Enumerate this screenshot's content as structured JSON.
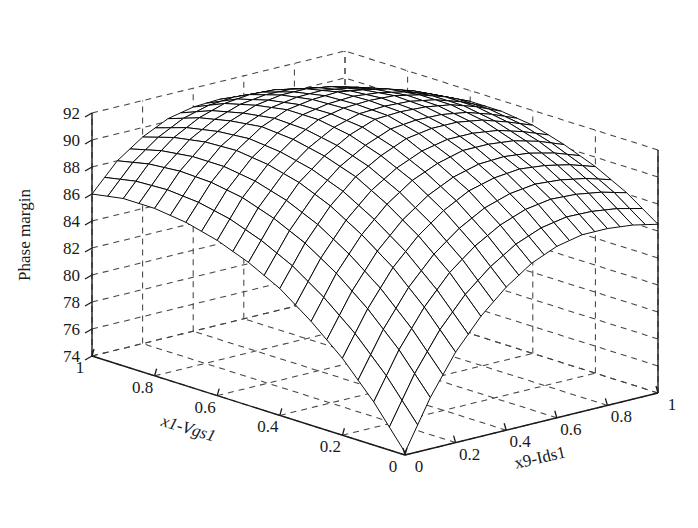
{
  "figure": {
    "background_color": "#ffffff",
    "line_color": "#1a1a1a",
    "grid_color": "#3a3a3a",
    "mesh_color": "#000000",
    "mesh_face_color": "#ffffff"
  },
  "chart_data": {
    "type": "surface",
    "title": "",
    "zlabel": "Phase margin",
    "xlabel": "x1-Vgs1",
    "ylabel": "x9-Ids1",
    "grid": true,
    "legend": "none",
    "projection": "3d-mesh",
    "xlim": [
      0,
      1
    ],
    "ylim": [
      0,
      1
    ],
    "zlim": [
      74,
      92
    ],
    "xticks": [
      "1",
      "0.8",
      "0.6",
      "0.4",
      "0.2",
      "0"
    ],
    "xtick_values": [
      1,
      0.8,
      0.6,
      0.4,
      0.2,
      0
    ],
    "yticks": [
      "0",
      "0.2",
      "0.4",
      "0.6",
      "0.8",
      "1"
    ],
    "ytick_values": [
      0,
      0.2,
      0.4,
      0.6,
      0.8,
      1
    ],
    "zticks": [
      "74",
      "76",
      "78",
      "80",
      "82",
      "84",
      "86",
      "88",
      "90",
      "92"
    ],
    "ztick_values": [
      74,
      76,
      78,
      80,
      82,
      84,
      86,
      88,
      90,
      92
    ],
    "x_axis_name": "x1-Vgs1",
    "y_axis_name": "x9-Ids1",
    "z_axis_name": "Phase margin",
    "x_grid_values": [
      0,
      0.2,
      0.4,
      0.6,
      0.8,
      1
    ],
    "y_grid_values": [
      0,
      0.2,
      0.4,
      0.6,
      0.8,
      1
    ],
    "mesh_nx": 21,
    "mesh_ny": 21,
    "surface_model": {
      "description": "Phase margin rises steeply as x1-Vgs1 decreases from 1 and as x9-Ids1 increases, saturating to a broad ridge near 92-93 and rolling off toward the x9=1 front-right corner.",
      "z_at_corners": {
        "x1_1_x9_0": 74.2,
        "x1_0_x9_0": 88.0,
        "x1_1_x9_1": 86.5,
        "x1_0_x9_1": 89.2
      },
      "z_peak": 93.0,
      "peak_at": [
        0.3,
        0.62
      ]
    },
    "z_grid_x": [
      0,
      0.1,
      0.2,
      0.3,
      0.4,
      0.5,
      0.6,
      0.7,
      0.8,
      0.9,
      1
    ],
    "z_grid_y": [
      0,
      0.1,
      0.2,
      0.3,
      0.4,
      0.5,
      0.6,
      0.7,
      0.8,
      0.9,
      1
    ],
    "z_values": [
      [
        74.2,
        77.8,
        80.7,
        82.9,
        84.6,
        85.9,
        86.7,
        87.1,
        87.1,
        86.9,
        86.5
      ],
      [
        77.2,
        80.6,
        83.3,
        85.4,
        86.9,
        88.0,
        88.7,
        89.0,
        88.9,
        88.6,
        88.1
      ],
      [
        79.7,
        82.9,
        85.5,
        87.4,
        88.8,
        89.8,
        90.3,
        90.5,
        90.3,
        89.9,
        89.3
      ],
      [
        81.7,
        84.8,
        87.2,
        89.0,
        90.3,
        91.1,
        91.6,
        91.6,
        91.4,
        90.9,
        90.2
      ],
      [
        83.4,
        86.3,
        88.6,
        90.3,
        91.4,
        92.2,
        92.5,
        92.5,
        92.2,
        91.6,
        90.9
      ],
      [
        84.6,
        87.4,
        89.6,
        91.1,
        92.2,
        92.9,
        93.0,
        92.9,
        92.6,
        92.0,
        91.2
      ],
      [
        85.5,
        88.2,
        90.2,
        91.6,
        92.6,
        93.0,
        93.1,
        93.0,
        92.6,
        92.0,
        91.2
      ],
      [
        86.1,
        88.6,
        90.5,
        91.8,
        92.6,
        92.9,
        93.0,
        92.7,
        92.3,
        91.7,
        90.9
      ],
      [
        86.4,
        88.7,
        90.4,
        91.5,
        92.2,
        92.5,
        92.5,
        92.2,
        91.7,
        91.0,
        90.3
      ],
      [
        86.4,
        88.5,
        90.0,
        91.0,
        91.6,
        91.8,
        91.7,
        91.3,
        90.8,
        90.1,
        89.4
      ],
      [
        86.0,
        88.0,
        89.3,
        90.2,
        90.6,
        90.7,
        90.5,
        90.1,
        89.5,
        88.8,
        88.0
      ]
    ]
  },
  "axes": {
    "z_title": "Phase margin",
    "x_title": "x1-Vgs1",
    "y_title": "x9-Ids1",
    "z_tick_labels": [
      "92",
      "90",
      "88",
      "86",
      "84",
      "82",
      "80",
      "78",
      "76",
      "74"
    ],
    "x_tick_labels": [
      "1",
      "0.8",
      "0.6",
      "0.4",
      "0.2",
      "0"
    ],
    "y_tick_labels": [
      "0",
      "0.2",
      "0.4",
      "0.6",
      "0.8",
      "1"
    ]
  }
}
